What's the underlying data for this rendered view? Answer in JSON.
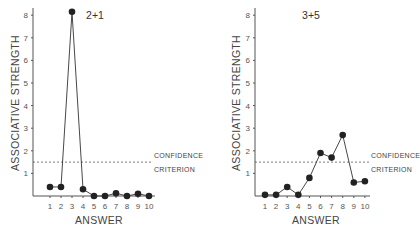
{
  "chart_data": [
    {
      "type": "line",
      "title": "2+1",
      "xlabel": "ANSWER",
      "ylabel": "ASSOCIATIVE STRENGTH",
      "x": [
        1,
        2,
        3,
        4,
        5,
        6,
        7,
        8,
        9,
        10
      ],
      "x_tick_labels": [
        "1",
        "2",
        "3",
        "4",
        "5",
        "6",
        "7",
        "8",
        "9",
        "10"
      ],
      "y_tick_labels": [
        "1",
        "2",
        "3",
        "4",
        "5",
        "6",
        "7",
        "8"
      ],
      "y_ticks": [
        1,
        2,
        3,
        4,
        5,
        6,
        7,
        8
      ],
      "ylim": [
        0,
        8.2
      ],
      "xlim": [
        0,
        10.5
      ],
      "series": [
        {
          "name": "associative strength",
          "values": [
            0.4,
            0.4,
            8.15,
            0.3,
            0.0,
            0.0,
            0.12,
            0.0,
            0.1,
            0.0
          ]
        }
      ],
      "reference_line": {
        "y": 1.5,
        "style": "dashed",
        "label_lines": [
          "CONFIDENCE",
          "CRITERION"
        ]
      },
      "grid": false
    },
    {
      "type": "line",
      "title": "3+5",
      "xlabel": "ANSWER",
      "ylabel": "ASSOCIATIVE STRENGTH",
      "x": [
        1,
        2,
        3,
        4,
        5,
        6,
        7,
        8,
        9,
        10
      ],
      "x_tick_labels": [
        "1",
        "2",
        "3",
        "4",
        "5",
        "6",
        "7",
        "8",
        "9",
        "10"
      ],
      "y_tick_labels": [
        "1",
        "2",
        "3",
        "4",
        "5",
        "6",
        "7",
        "8"
      ],
      "y_ticks": [
        1,
        2,
        3,
        4,
        5,
        6,
        7,
        8
      ],
      "ylim": [
        0,
        8.2
      ],
      "xlim": [
        0,
        10.5
      ],
      "series": [
        {
          "name": "associative strength",
          "values": [
            0.05,
            0.05,
            0.4,
            0.05,
            0.8,
            1.9,
            1.7,
            2.7,
            0.6,
            0.65
          ]
        }
      ],
      "reference_line": {
        "y": 1.5,
        "style": "dashed",
        "label_lines": [
          "CONFIDENCE",
          "CRITERION"
        ]
      },
      "grid": false
    }
  ]
}
